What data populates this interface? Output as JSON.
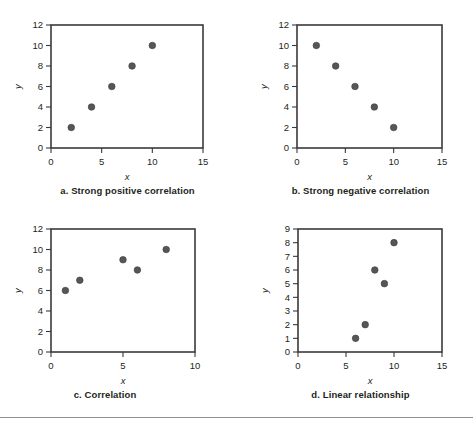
{
  "figure": {
    "background": "#ffffff",
    "point_color": "#55555a",
    "axis_color": "#3a3a3c",
    "rule_color": "#8e8e93"
  },
  "chart_data": [
    {
      "id": "a",
      "type": "scatter",
      "title": "a. Strong positive correlation",
      "xlabel": "x",
      "ylabel": "y",
      "xlim": [
        0,
        15
      ],
      "ylim": [
        0,
        12
      ],
      "xticks": [
        0,
        5,
        10,
        15
      ],
      "yticks": [
        0,
        2,
        4,
        6,
        8,
        10,
        12
      ],
      "grid": false,
      "legend": "none",
      "points": [
        {
          "x": 2,
          "y": 2
        },
        {
          "x": 4,
          "y": 4
        },
        {
          "x": 6,
          "y": 6
        },
        {
          "x": 8,
          "y": 8
        },
        {
          "x": 10,
          "y": 10
        }
      ]
    },
    {
      "id": "b",
      "type": "scatter",
      "title": "b. Strong negative correlation",
      "xlabel": "x",
      "ylabel": "y",
      "xlim": [
        0,
        15
      ],
      "ylim": [
        0,
        12
      ],
      "xticks": [
        0,
        5,
        10,
        15
      ],
      "yticks": [
        0,
        2,
        4,
        6,
        8,
        10,
        12
      ],
      "grid": false,
      "legend": "none",
      "points": [
        {
          "x": 2,
          "y": 10
        },
        {
          "x": 4,
          "y": 8
        },
        {
          "x": 6,
          "y": 6
        },
        {
          "x": 8,
          "y": 4
        },
        {
          "x": 10,
          "y": 2
        }
      ]
    },
    {
      "id": "c",
      "type": "scatter",
      "title": "c. Correlation",
      "xlabel": "x",
      "ylabel": "y",
      "xlim": [
        0,
        10
      ],
      "ylim": [
        0,
        12
      ],
      "xticks": [
        0,
        5,
        10
      ],
      "yticks": [
        0,
        2,
        4,
        6,
        8,
        10,
        12
      ],
      "grid": false,
      "legend": "none",
      "points": [
        {
          "x": 1,
          "y": 6
        },
        {
          "x": 2,
          "y": 7
        },
        {
          "x": 5,
          "y": 9
        },
        {
          "x": 6,
          "y": 8
        },
        {
          "x": 8,
          "y": 10
        }
      ]
    },
    {
      "id": "d",
      "type": "scatter",
      "title": "d. Linear relationship",
      "xlabel": "x",
      "ylabel": "y",
      "xlim": [
        0,
        15
      ],
      "ylim": [
        0,
        9
      ],
      "xticks": [
        0,
        5,
        10,
        15
      ],
      "yticks": [
        0,
        1,
        2,
        3,
        4,
        5,
        6,
        7,
        8,
        9
      ],
      "grid": false,
      "legend": "none",
      "points": [
        {
          "x": 6,
          "y": 1
        },
        {
          "x": 7,
          "y": 2
        },
        {
          "x": 8,
          "y": 6
        },
        {
          "x": 9,
          "y": 5
        },
        {
          "x": 10,
          "y": 8
        }
      ]
    }
  ],
  "captions": {
    "a": "a. Strong positive correlation",
    "b": "b. Strong negative correlation",
    "c": "c. Correlation",
    "d": "d. Linear relationship"
  }
}
